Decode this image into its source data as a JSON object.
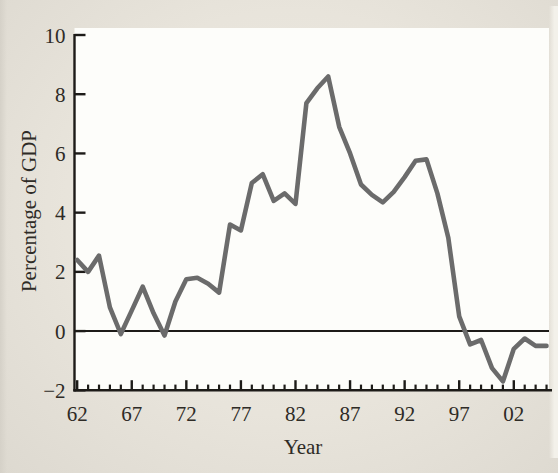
{
  "figure": {
    "page_background": "#e8e4db",
    "plot_background": "#fdfdfa",
    "axis_color": "#1d1b18",
    "text_color": "#2e2b26"
  },
  "chart_data": {
    "type": "line",
    "title": "",
    "xlabel": "Year",
    "ylabel": "Percentage of GDP",
    "x_range": [
      1961.8,
      2005.5
    ],
    "ylim": [
      -2,
      10
    ],
    "y_ticks": [
      -2,
      0,
      2,
      4,
      6,
      8,
      10
    ],
    "y_tick_labels": [
      "−2",
      "0",
      "2",
      "4",
      "6",
      "8",
      "10"
    ],
    "x_major_ticks": [
      1962,
      1967,
      1972,
      1977,
      1982,
      1987,
      1992,
      1997,
      2002
    ],
    "x_major_tick_labels": [
      "62",
      "67",
      "72",
      "77",
      "82",
      "87",
      "92",
      "97",
      "02"
    ],
    "x_minor_tick_interval": 1,
    "grid": false,
    "legend": false,
    "zero_line": true,
    "line_color": "#6b6b6b",
    "line_width": 4.6,
    "x": [
      1962,
      1963,
      1964,
      1965,
      1966,
      1967,
      1968,
      1969,
      1970,
      1971,
      1972,
      1973,
      1974,
      1975,
      1976,
      1977,
      1978,
      1979,
      1980,
      1981,
      1982,
      1983,
      1984,
      1985,
      1986,
      1987,
      1988,
      1989,
      1990,
      1991,
      1992,
      1993,
      1994,
      1995,
      1996,
      1997,
      1998,
      1999,
      2000,
      2001,
      2002,
      2003,
      2004,
      2005
    ],
    "values": [
      2.4,
      2.0,
      2.55,
      0.8,
      -0.1,
      0.7,
      1.5,
      0.6,
      -0.15,
      1.0,
      1.75,
      1.8,
      1.6,
      1.3,
      3.6,
      3.4,
      5.0,
      5.3,
      4.4,
      4.65,
      4.3,
      7.7,
      8.2,
      8.6,
      6.9,
      6.0,
      4.95,
      4.6,
      4.35,
      4.7,
      5.2,
      5.75,
      5.8,
      4.65,
      3.15,
      0.5,
      -0.45,
      -0.3,
      -1.25,
      -1.7,
      -0.6,
      -0.25,
      -0.5,
      -0.5
    ]
  }
}
